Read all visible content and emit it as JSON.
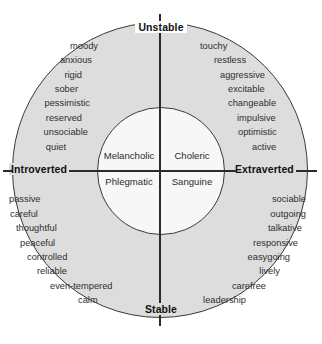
{
  "diagram": {
    "colors": {
      "outer_ring": "#dddddd",
      "inner_circle": "#f7f7f7",
      "line": "#2b2b2b",
      "background": "#ffffff",
      "text": "#2f2f2f"
    },
    "axes": {
      "vertical": {
        "top_label": "Unstable",
        "bottom_label": "Stable"
      },
      "horizontal": {
        "left_label": "Introverted",
        "right_label": "Extraverted"
      }
    },
    "temperaments": {
      "top_left": "Melancholic",
      "top_right": "Choleric",
      "bottom_left": "Phlegmatic",
      "bottom_right": "Sanguine"
    },
    "quadrants": {
      "unstable_introverted": {
        "temperament": "Melancholic",
        "traits": [
          "moody",
          "anxious",
          "rigid",
          "sober",
          "pessimistic",
          "reserved",
          "unsociable",
          "quiet"
        ]
      },
      "unstable_extraverted": {
        "temperament": "Choleric",
        "traits": [
          "touchy",
          "restless",
          "aggressive",
          "excitable",
          "changeable",
          "impulsive",
          "optimistic",
          "active"
        ]
      },
      "stable_introverted": {
        "temperament": "Phlegmatic",
        "traits": [
          "passive",
          "careful",
          "thoughtful",
          "peaceful",
          "controlled",
          "reliable",
          "even-tempered",
          "calm"
        ]
      },
      "stable_extraverted": {
        "temperament": "Sanguine",
        "traits": [
          "sociable",
          "outgoing",
          "talkative",
          "responsive",
          "easygoing",
          "lively",
          "carefree",
          "leadership"
        ]
      }
    }
  }
}
